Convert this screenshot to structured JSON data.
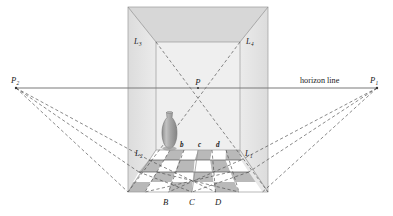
{
  "figure": {
    "title_text": "horizon line",
    "background_color": "#ffffff",
    "line_color": "#6e6e6e",
    "dashed_color": "#4a4a4a",
    "wall_fill": "#e4e4e4",
    "back_wall_fill": "#efefef",
    "tile_gray": "#b9b9b9",
    "tile_white": "#ffffff",
    "vase_fill": "#a9a9a9",
    "text_color": "#1a1a1a"
  },
  "labels": {
    "vanishing_left": {
      "base": "P",
      "sub": "2"
    },
    "vanishing_right": {
      "base": "P",
      "sub": "1"
    },
    "center_point": {
      "base": "P",
      "sub": ""
    },
    "horizon": "horizon line",
    "corner_back_left": {
      "base": "L",
      "sub": "3"
    },
    "corner_back_right": {
      "base": "L",
      "sub": "4"
    },
    "floor_left": {
      "base": "L",
      "sub": "2"
    },
    "floor_right": {
      "base": "L",
      "sub": "1"
    },
    "tile_marks_top": [
      "b",
      "c",
      "d"
    ],
    "tile_marks_bottom": [
      "B",
      "C",
      "D"
    ]
  },
  "geometry": {
    "room_left": 128,
    "room_right": 268,
    "room_top": 7,
    "room_bottom": 192,
    "back_left": 156,
    "back_right": 240,
    "back_top": 42,
    "back_bottom": 150,
    "horizon_y": 88,
    "center_point_x": 198,
    "center_point_y": 88,
    "vanish_left_x": 16,
    "vanish_right_x": 377
  }
}
